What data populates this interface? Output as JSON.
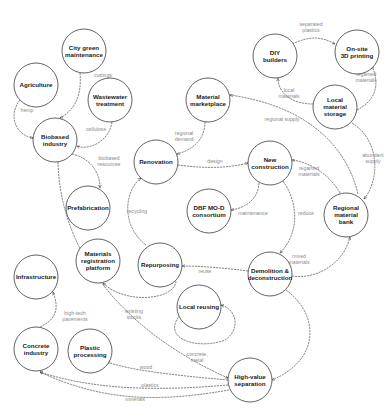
{
  "diagram": {
    "nodes": [
      {
        "id": "city-green-maintenance",
        "lines": [
          "City green",
          "maintenance"
        ],
        "x": 84,
        "y": 51
      },
      {
        "id": "agriculture",
        "lines": [
          "Agriculture"
        ],
        "x": 36,
        "y": 85
      },
      {
        "id": "wastewater-treatment",
        "lines": [
          "Wastewater",
          "treatment"
        ],
        "x": 110,
        "y": 100
      },
      {
        "id": "biobased-industry",
        "lines": [
          "Biobased",
          "industry"
        ],
        "x": 55,
        "y": 140
      },
      {
        "id": "material-marketplace",
        "lines": [
          "Material",
          "marketplace"
        ],
        "x": 208,
        "y": 100
      },
      {
        "id": "diy-builders",
        "lines": [
          "DIY",
          "builders"
        ],
        "x": 275,
        "y": 56
      },
      {
        "id": "on-site-3d-printing",
        "lines": [
          "On-site",
          "3D printing"
        ],
        "x": 357,
        "y": 52
      },
      {
        "id": "local-material-storage",
        "lines": [
          "Local",
          "material",
          "storage"
        ],
        "x": 335,
        "y": 107
      },
      {
        "id": "renovation",
        "lines": [
          "Renovation"
        ],
        "x": 156,
        "y": 162
      },
      {
        "id": "new-construction",
        "lines": [
          "New",
          "construction"
        ],
        "x": 270,
        "y": 163
      },
      {
        "id": "regional-material-bank",
        "lines": [
          "Regional",
          "material",
          "bank"
        ],
        "x": 346,
        "y": 215
      },
      {
        "id": "prefabrication",
        "lines": [
          "Prefabrication"
        ],
        "x": 88,
        "y": 208
      },
      {
        "id": "dbf-mo-d-consortium",
        "lines": [
          "DBF MO-D",
          "consortium"
        ],
        "x": 209,
        "y": 211
      },
      {
        "id": "materials-registration-platform",
        "lines": [
          "Materials",
          "registration",
          "platform"
        ],
        "x": 98,
        "y": 261
      },
      {
        "id": "repurposing",
        "lines": [
          "Repurposing"
        ],
        "x": 160,
        "y": 265
      },
      {
        "id": "demolition-deconstruction",
        "lines": [
          "Demolition &",
          "deconstruction"
        ],
        "x": 270,
        "y": 274
      },
      {
        "id": "local-reusing",
        "lines": [
          "Local reusing"
        ],
        "x": 199,
        "y": 307
      },
      {
        "id": "infrastructure",
        "lines": [
          "Infrastructure"
        ],
        "x": 36,
        "y": 277
      },
      {
        "id": "concrete-industry",
        "lines": [
          "Concrete",
          "industry"
        ],
        "x": 36,
        "y": 349
      },
      {
        "id": "plastic-processing",
        "lines": [
          "Plastic",
          "processing"
        ],
        "x": 90,
        "y": 351
      },
      {
        "id": "high-value-separation",
        "lines": [
          "High-value",
          "separation"
        ],
        "x": 250,
        "y": 380
      }
    ],
    "edges": [
      {
        "id": "cuttings",
        "label": [
          "cuttings"
        ],
        "path": "M80,73 C82,95 75,110 60,118",
        "lx": 103,
        "ly": 77
      },
      {
        "id": "hemp",
        "label": [
          "hemp"
        ],
        "path": "M20,100 C8,115 15,135 33,138",
        "lx": 27,
        "ly": 112
      },
      {
        "id": "cellulose",
        "label": [
          "cellulose"
        ],
        "path": "M112,122 C108,145 85,150 77,146",
        "lx": 96,
        "ly": 131
      },
      {
        "id": "biobased-resources",
        "label": [
          "biobased",
          "resources"
        ],
        "path": "M72,154 C90,158 100,172 100,188",
        "lx": 109,
        "ly": 160
      },
      {
        "id": "regional-demand",
        "label": [
          "regional",
          "demand"
        ],
        "path": "M205,122 C205,140 192,150 177,154",
        "lx": 184,
        "ly": 135
      },
      {
        "id": "design",
        "label": [
          "design"
        ],
        "path": "M178,165 C200,168 226,169 248,163",
        "lx": 215,
        "ly": 163
      },
      {
        "id": "separated-plastics",
        "label": [
          "separated",
          "plastics"
        ],
        "path": "M292,44 C310,36 320,36 335,44",
        "lx": 311,
        "ly": 26
      },
      {
        "id": "local-materials",
        "label": [
          "local",
          "materials"
        ],
        "path": "M313,104 C290,104 278,92 278,78",
        "lx": 289,
        "ly": 92
      },
      {
        "id": "regained-materials",
        "label": [
          "regained",
          "materials"
        ],
        "path": "M357,110 C376,100 380,85 372,66",
        "lx": 366,
        "ly": 76
      },
      {
        "id": "regional-supply",
        "label": [
          "regional supply"
        ],
        "path": "M358,194 C345,140 300,105 230,95",
        "lx": 282,
        "ly": 121
      },
      {
        "id": "abundant-supply",
        "label": [
          "abundant",
          "supply"
        ],
        "path": "M352,123 C380,140 380,180 364,199",
        "lx": 373,
        "ly": 157
      },
      {
        "id": "regained-materials-nc",
        "label": [
          "regained",
          "materials"
        ],
        "path": "M340,193 C330,175 310,162 292,160",
        "lx": 309,
        "ly": 170
      },
      {
        "id": "maintenance",
        "label": [
          "maintenance"
        ],
        "path": "M259,183 C258,200 245,208 231,210",
        "lx": 253,
        "ly": 215
      },
      {
        "id": "reduce",
        "label": [
          "reduce"
        ],
        "path": "M283,181 C300,205 298,235 280,253",
        "lx": 306,
        "ly": 215
      },
      {
        "id": "mixed-materials",
        "label": [
          "mixed",
          "materials"
        ],
        "path": "M292,276 C320,280 345,260 350,237",
        "lx": 299,
        "ly": 258
      },
      {
        "id": "reuse",
        "label": [
          "reuse"
        ],
        "path": "M248,271 C225,268 200,266 182,266",
        "lx": 205,
        "ly": 273
      },
      {
        "id": "recycling",
        "label": [
          "recycling"
        ],
        "path": "M146,245 C120,225 125,190 141,178",
        "lx": 137,
        "ly": 213
      },
      {
        "id": "existing-stocks",
        "label": [
          "existing",
          "stocks"
        ],
        "path": "M176,281 C175,300 125,305 103,283",
        "lx": 134,
        "ly": 313
      },
      {
        "id": "concrete-metal",
        "label": [
          "concrete,",
          "metal"
        ],
        "path": "M180,315 C160,340 200,350 225,340 C240,330 238,310 221,305",
        "lx": 197,
        "ly": 356
      },
      {
        "id": "high-tech-pavements",
        "label": [
          "high-tech",
          "pavements"
        ],
        "path": "M40,327 C55,320 60,310 53,292",
        "lx": 75,
        "ly": 315
      },
      {
        "id": "wood",
        "label": [
          "wood"
        ],
        "path": "M228,380 C170,375 130,370 107,362",
        "lx": 146,
        "ly": 369
      },
      {
        "id": "plastics",
        "label": [
          "plastics"
        ],
        "path": "M228,385 C170,390 100,392 40,372",
        "lx": 150,
        "ly": 387
      },
      {
        "id": "minerals",
        "label": [
          "minerals"
        ],
        "path": "M229,390 C170,400 110,405 40,372",
        "lx": 135,
        "ly": 401
      },
      {
        "id": "demolition-to-separation",
        "label": [],
        "path": "M286,290 C320,315 320,360 272,380",
        "lx": 0,
        "ly": 0
      },
      {
        "id": "biobased-to-separation",
        "label": [],
        "path": "M58,162 C60,250 120,330 228,378",
        "lx": 0,
        "ly": 0
      }
    ]
  }
}
